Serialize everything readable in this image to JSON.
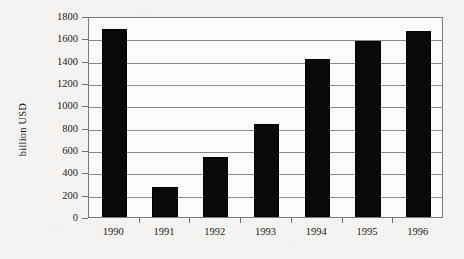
{
  "chart_data": {
    "type": "bar",
    "title": "",
    "subtitle": "",
    "xlabel": "",
    "ylabel": "billion USD",
    "categories": [
      "1990",
      "1991",
      "1992",
      "1993",
      "1994",
      "1995",
      "1996"
    ],
    "values": [
      1685,
      270,
      540,
      835,
      1415,
      1575,
      1670
    ],
    "series": [
      {
        "name": "billion USD",
        "values": [
          1685,
          270,
          540,
          835,
          1415,
          1575,
          1670
        ]
      }
    ],
    "ylim": [
      0,
      1800
    ],
    "ytick_values": [
      0,
      200,
      400,
      600,
      800,
      1000,
      1200,
      1400,
      1600,
      1800
    ],
    "ytick_labels": [
      "0",
      "200",
      "400",
      "600",
      "800",
      "1000",
      "1200",
      "1400",
      "1600",
      "1800"
    ],
    "xtick_labels": [
      "1990",
      "1991",
      "1992",
      "1993",
      "1994",
      "1995",
      "1996"
    ],
    "grid": true,
    "grid_axis": "y",
    "legend": false,
    "legend_position": "none",
    "annotations": [],
    "colors": {
      "bar_fill": "#0a0a0a",
      "bar_edge": "#000000",
      "gridline": "#8a8a8a",
      "axis": "#7b7b7b",
      "text": "#1a1a1a",
      "plot_background": "#fbfbfa",
      "page_background": "#f4f3f1"
    }
  }
}
